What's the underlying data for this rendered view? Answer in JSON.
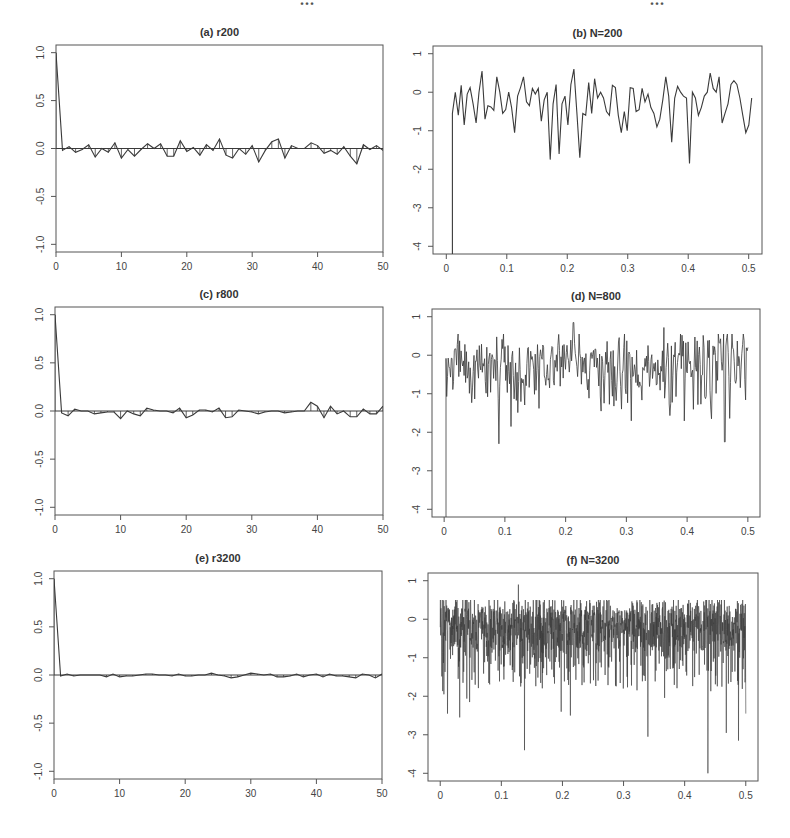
{
  "page": {
    "header_fragment_left": "...",
    "header_fragment_right": "...",
    "colors": {
      "line": "#3a3a3a",
      "axis": "#555555",
      "background": "#ffffff"
    }
  },
  "chart_data": [
    {
      "id": "a",
      "type": "line",
      "title": "(a) r200",
      "subtitle": "Sample autocorrelation (stem + line), N=200",
      "xlabel": "",
      "ylabel": "",
      "xlim": [
        0,
        50
      ],
      "ylim": [
        -1.08,
        1.08
      ],
      "xticks": [
        0,
        10,
        20,
        30,
        40,
        50
      ],
      "xtick_labels": [
        "0",
        "10",
        "20",
        "30",
        "40",
        "50"
      ],
      "yticks": [
        -1.0,
        -0.5,
        0.0,
        0.5,
        1.0
      ],
      "ytick_labels": [
        "-1.0",
        "-0.5",
        "0.0",
        "0.5",
        "1.0"
      ],
      "grid": false,
      "hline": 0,
      "stems": true,
      "x": [
        0,
        1,
        2,
        3,
        4,
        5,
        6,
        7,
        8,
        9,
        10,
        11,
        12,
        13,
        14,
        15,
        16,
        17,
        18,
        19,
        20,
        21,
        22,
        23,
        24,
        25,
        26,
        27,
        28,
        29,
        30,
        31,
        32,
        33,
        34,
        35,
        36,
        37,
        38,
        39,
        40,
        41,
        42,
        43,
        44,
        45,
        46,
        47,
        48,
        49,
        50
      ],
      "values": [
        1.0,
        -0.02,
        0.02,
        -0.04,
        -0.01,
        0.04,
        -0.09,
        0.0,
        -0.04,
        0.06,
        -0.1,
        -0.01,
        -0.08,
        -0.01,
        0.05,
        0.0,
        0.05,
        -0.08,
        -0.08,
        0.08,
        -0.03,
        0.01,
        -0.07,
        0.04,
        -0.02,
        0.1,
        -0.07,
        -0.1,
        0.0,
        -0.06,
        0.03,
        -0.14,
        -0.02,
        0.07,
        0.1,
        -0.1,
        0.03,
        0.0,
        0.0,
        0.06,
        0.03,
        -0.05,
        -0.02,
        -0.06,
        0.02,
        -0.08,
        -0.16,
        0.04,
        -0.01,
        0.03,
        -0.02
      ]
    },
    {
      "id": "b",
      "type": "line",
      "title": "(b) N=200",
      "subtitle": "Log periodogram, N=200",
      "xlabel": "",
      "ylabel": "",
      "xlim": [
        -0.022,
        0.522
      ],
      "ylim": [
        -4.2,
        1.2
      ],
      "xticks": [
        0,
        0.1,
        0.2,
        0.3,
        0.4,
        0.5
      ],
      "xtick_labels": [
        "0",
        "0.1",
        "0.2",
        "0.3",
        "0.4",
        "0.5"
      ],
      "yticks": [
        -4,
        -3,
        -2,
        -1,
        0,
        1
      ],
      "ytick_labels": [
        "-4",
        "-3",
        "-2",
        "-1",
        "0",
        "1"
      ],
      "grid": false,
      "x_start": 0.01,
      "x_end": 0.505,
      "first_value": -4.2,
      "values": [
        -0.55,
        0.0,
        -0.6,
        0.18,
        -0.85,
        -0.05,
        0.12,
        -0.3,
        -0.8,
        0.0,
        0.55,
        -0.7,
        -0.35,
        -0.38,
        -0.47,
        0.4,
        0.0,
        -0.55,
        -0.45,
        0.0,
        -0.4,
        -1.05,
        -0.1,
        0.12,
        0.4,
        -0.25,
        -0.35,
        0.1,
        -0.05,
        0.1,
        -0.75,
        -0.2,
        0.0,
        -1.75,
        -0.3,
        0.2,
        -1.6,
        -0.3,
        -0.1,
        -0.85,
        0.2,
        0.6,
        -0.5,
        -1.7,
        -0.55,
        -0.6,
        0.25,
        -0.55,
        0.35,
        -0.15,
        0.0,
        -0.15,
        -0.5,
        -0.6,
        0.18,
        0.12,
        -0.6,
        -1.05,
        -0.5,
        -1.0,
        0.12,
        0.1,
        -0.5,
        -0.45,
        0.1,
        -0.25,
        -0.05,
        -0.4,
        -0.55,
        -0.9,
        -0.7,
        -0.2,
        0.4,
        -0.1,
        -1.3,
        -0.15,
        0.15,
        0.0,
        -0.1,
        -0.15,
        -1.85,
        0.0,
        -0.15,
        -0.6,
        -0.4,
        -0.1,
        0.0,
        0.5,
        0.1,
        0.0,
        0.4,
        -0.8,
        -0.55,
        -0.3,
        0.2,
        0.3,
        0.2,
        -0.15,
        -0.6,
        -1.05,
        -0.85,
        -0.15
      ]
    },
    {
      "id": "c",
      "type": "line",
      "title": "(c) r800",
      "subtitle": "Sample autocorrelation (stem + line), N=800",
      "xlabel": "",
      "ylabel": "",
      "xlim": [
        0,
        50
      ],
      "ylim": [
        -1.08,
        1.08
      ],
      "xticks": [
        0,
        10,
        20,
        30,
        40,
        50
      ],
      "xtick_labels": [
        "0",
        "10",
        "20",
        "30",
        "40",
        "50"
      ],
      "yticks": [
        -1.0,
        -0.5,
        0.0,
        0.5,
        1.0
      ],
      "ytick_labels": [
        "-1.0",
        "-0.5",
        "0.0",
        "0.5",
        "1.0"
      ],
      "grid": false,
      "hline": 0,
      "stems": true,
      "x": [
        0,
        1,
        2,
        3,
        4,
        5,
        6,
        7,
        8,
        9,
        10,
        11,
        12,
        13,
        14,
        15,
        16,
        17,
        18,
        19,
        20,
        21,
        22,
        23,
        24,
        25,
        26,
        27,
        28,
        29,
        30,
        31,
        32,
        33,
        34,
        35,
        36,
        37,
        38,
        39,
        40,
        41,
        42,
        43,
        44,
        45,
        46,
        47,
        48,
        49,
        50
      ],
      "values": [
        1.0,
        -0.02,
        -0.05,
        0.02,
        0.0,
        0.0,
        -0.03,
        -0.02,
        -0.01,
        -0.01,
        -0.08,
        0.0,
        -0.03,
        -0.05,
        0.03,
        0.01,
        0.0,
        0.0,
        -0.02,
        0.03,
        -0.07,
        -0.04,
        0.01,
        0.01,
        -0.01,
        0.03,
        -0.07,
        -0.06,
        0.01,
        0.0,
        -0.01,
        -0.03,
        -0.01,
        0.0,
        0.0,
        -0.02,
        -0.01,
        0.0,
        0.0,
        0.09,
        0.05,
        -0.07,
        0.05,
        -0.03,
        0.0,
        -0.06,
        -0.06,
        0.02,
        -0.03,
        -0.03,
        0.05
      ]
    },
    {
      "id": "d",
      "type": "line",
      "title": "(d) N=800",
      "subtitle": "Log periodogram, N=800",
      "xlabel": "",
      "ylabel": "",
      "xlim": [
        -0.02,
        0.52
      ],
      "ylim": [
        -4.2,
        1.2
      ],
      "xticks": [
        0,
        0.1,
        0.2,
        0.3,
        0.4,
        0.5
      ],
      "xtick_labels": [
        "0",
        "0.1",
        "0.2",
        "0.3",
        "0.4",
        "0.5"
      ],
      "yticks": [
        -4,
        -3,
        -2,
        -1,
        0,
        1
      ],
      "ytick_labels": [
        "-4",
        "-3",
        "-2",
        "-1",
        "0",
        "1"
      ],
      "grid": false,
      "x_start": 0.003,
      "x_end": 0.5,
      "first_value": -4.2,
      "n_points": 400,
      "noise": {
        "seed": 8,
        "center": -0.25,
        "upper": 0.55,
        "lower_typ": -1.2
      },
      "annotated_points": [
        {
          "x": 0.005,
          "y": -0.55
        },
        {
          "x": 0.09,
          "y": -2.3
        },
        {
          "x": 0.11,
          "y": -1.85
        },
        {
          "x": 0.213,
          "y": 0.85
        },
        {
          "x": 0.258,
          "y": -1.45
        },
        {
          "x": 0.292,
          "y": -1.4
        },
        {
          "x": 0.362,
          "y": 0.72
        },
        {
          "x": 0.44,
          "y": -1.65
        },
        {
          "x": 0.462,
          "y": -2.25
        },
        {
          "x": 0.5,
          "y": 0.2
        }
      ]
    },
    {
      "id": "e",
      "type": "line",
      "title": "(e) r3200",
      "subtitle": "Sample autocorrelation (stem + line), N=3200",
      "xlabel": "",
      "ylabel": "",
      "xlim": [
        0,
        50
      ],
      "ylim": [
        -1.08,
        1.08
      ],
      "xticks": [
        0,
        10,
        20,
        30,
        40,
        50
      ],
      "xtick_labels": [
        "0",
        "10",
        "20",
        "30",
        "40",
        "50"
      ],
      "yticks": [
        -1.0,
        -0.5,
        0.0,
        0.5,
        1.0
      ],
      "ytick_labels": [
        "-1.0",
        "-0.5",
        "0.0",
        "0.5",
        "1.0"
      ],
      "grid": false,
      "hline": 0,
      "stems": true,
      "x": [
        0,
        1,
        2,
        3,
        4,
        5,
        6,
        7,
        8,
        9,
        10,
        11,
        12,
        13,
        14,
        15,
        16,
        17,
        18,
        19,
        20,
        21,
        22,
        23,
        24,
        25,
        26,
        27,
        28,
        29,
        30,
        31,
        32,
        33,
        34,
        35,
        36,
        37,
        38,
        39,
        40,
        41,
        42,
        43,
        44,
        45,
        46,
        47,
        48,
        49,
        50
      ],
      "values": [
        1.0,
        -0.01,
        0.01,
        -0.01,
        0.0,
        0.0,
        0.0,
        0.0,
        -0.02,
        0.01,
        -0.02,
        -0.01,
        -0.01,
        0.0,
        0.01,
        0.01,
        0.0,
        0.0,
        -0.01,
        0.01,
        -0.01,
        -0.01,
        0.0,
        0.0,
        0.02,
        0.0,
        -0.01,
        -0.03,
        -0.02,
        0.0,
        0.02,
        0.01,
        0.0,
        0.01,
        -0.02,
        -0.02,
        -0.01,
        0.01,
        -0.02,
        0.0,
        0.01,
        -0.02,
        0.01,
        -0.01,
        -0.01,
        -0.02,
        -0.03,
        0.01,
        0.0,
        -0.03,
        0.01
      ]
    },
    {
      "id": "f",
      "type": "line",
      "title": "(f) N=3200",
      "subtitle": "Log periodogram, N=3200",
      "xlabel": "",
      "ylabel": "",
      "xlim": [
        -0.02,
        0.52
      ],
      "ylim": [
        -4.2,
        1.2
      ],
      "xticks": [
        0,
        0.1,
        0.2,
        0.3,
        0.4,
        0.5
      ],
      "xtick_labels": [
        "0",
        "0.1",
        "0.2",
        "0.3",
        "0.4",
        "0.5"
      ],
      "yticks": [
        -4,
        -3,
        -2,
        -1,
        0,
        1
      ],
      "ytick_labels": [
        "-4",
        "-3",
        "-2",
        "-1",
        "0",
        "1"
      ],
      "grid": false,
      "x_start": 0.0,
      "x_end": 0.5,
      "n_points": 1600,
      "noise": {
        "seed": 32,
        "center": -0.3,
        "upper": 0.5,
        "lower_typ": -1.6
      },
      "annotated_points": [
        {
          "x": 0.006,
          "y": -1.95
        },
        {
          "x": 0.012,
          "y": -2.45
        },
        {
          "x": 0.032,
          "y": -2.55
        },
        {
          "x": 0.048,
          "y": -2.15
        },
        {
          "x": 0.128,
          "y": 0.9
        },
        {
          "x": 0.138,
          "y": -3.4
        },
        {
          "x": 0.198,
          "y": -2.4
        },
        {
          "x": 0.213,
          "y": -2.5
        },
        {
          "x": 0.34,
          "y": -3.05
        },
        {
          "x": 0.438,
          "y": -4.0
        },
        {
          "x": 0.468,
          "y": -2.95
        },
        {
          "x": 0.488,
          "y": -3.15
        },
        {
          "x": 0.5,
          "y": -2.45
        }
      ]
    }
  ]
}
